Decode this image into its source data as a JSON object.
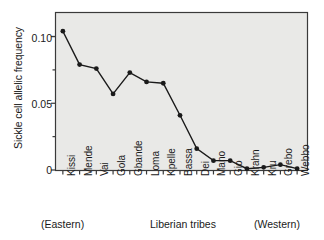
{
  "chart_data": {
    "type": "line",
    "title": "",
    "xlabel": "Liberian tribes",
    "ylabel": "Sickle cell allelic frequency",
    "categories": [
      "Kissi",
      "Mende",
      "Vai",
      "Gola",
      "Gbande",
      "Loma",
      "Kpelle",
      "Bassa",
      "Dei",
      "Mano",
      "Gio",
      "Krahn",
      "Kru",
      "Grebo",
      "Webbo"
    ],
    "values": [
      0.104,
      0.079,
      0.076,
      0.057,
      0.073,
      0.066,
      0.065,
      0.041,
      0.016,
      0.007,
      0.007,
      0.001,
      0.002,
      0.004,
      0.001
    ],
    "ylim": [
      0,
      0.118
    ],
    "ytick_values": [
      0,
      0.05,
      0.1
    ],
    "ytick_labels": [
      "0",
      "0.05",
      "0.10"
    ],
    "yminor_tick_values": [
      0.025,
      0.075,
      0.1
    ],
    "grid": false,
    "legend": null,
    "marker": "filled-circle",
    "series_color": "#1a1a1a",
    "plot_background": "#e9e9e7",
    "annotations": {
      "left_region": "(Eastern)",
      "right_region": "(Western)"
    }
  },
  "axis": {
    "y_title": "Sickle cell allelic frequency",
    "x_title": "Liberian tribes"
  },
  "footer": {
    "eastern": "(Eastern)",
    "center": "Liberian tribes",
    "western": "(Western)"
  }
}
